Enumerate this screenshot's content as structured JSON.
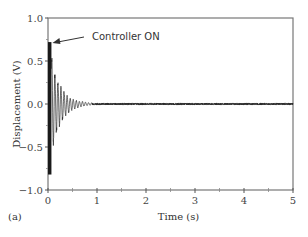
{
  "chart_data": {
    "type": "line",
    "title": "",
    "panel_label": "(a)",
    "xlabel": "Time (s)",
    "ylabel": "Displacement (V)",
    "xlim": [
      0,
      5
    ],
    "ylim": [
      -1.0,
      1.0
    ],
    "x_ticks": [
      "0",
      "1",
      "2",
      "3",
      "4",
      "5"
    ],
    "y_ticks": [
      "1.0",
      "0.5",
      "0.0",
      "−0.5",
      "−1.0"
    ],
    "grid": false,
    "legend": null,
    "annotation": {
      "text": "Controller ON",
      "points_to": {
        "x": 0.07,
        "y": 0.72
      }
    },
    "series": [
      {
        "name": "Displacement",
        "description": "Dense uncontrolled oscillation block 0–0.07 s spanning about +0.72 to −0.82 V, then a decaying oscillation after controller ON that settles near 0 V by about 0.9 s, with small residual noise (±0.01 V) out to 5 s",
        "envelope": {
          "x": [
            0.0,
            0.07,
            0.1,
            0.15,
            0.2,
            0.3,
            0.4,
            0.5,
            0.6,
            0.7,
            0.8,
            0.9,
            1.0,
            2.0,
            3.0,
            4.0,
            5.0
          ],
          "upper": [
            0.72,
            0.72,
            0.48,
            0.38,
            0.3,
            0.18,
            0.1,
            0.06,
            0.04,
            0.03,
            0.02,
            0.015,
            0.01,
            0.01,
            0.01,
            0.01,
            0.01
          ],
          "lower": [
            -0.82,
            -0.82,
            -0.55,
            -0.42,
            -0.32,
            -0.2,
            -0.12,
            -0.07,
            -0.05,
            -0.03,
            -0.02,
            -0.015,
            -0.01,
            -0.01,
            -0.01,
            -0.01,
            -0.01
          ]
        }
      }
    ]
  }
}
